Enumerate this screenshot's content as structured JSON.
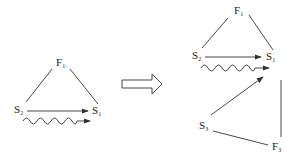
{
  "left_diagram": {
    "top_label": {
      "base": "F",
      "sub": "1"
    },
    "left_label": {
      "base": "S",
      "sub": "2"
    },
    "right_label": {
      "base": "S",
      "sub": "1"
    }
  },
  "right_diagram": {
    "top_label": {
      "base": "F",
      "sub": "1"
    },
    "left_label": {
      "base": "S",
      "sub": "2"
    },
    "right_label": {
      "base": "S",
      "sub": "1"
    },
    "bottom_left_label": {
      "base": "S",
      "sub": "3"
    },
    "bottom_right_label": {
      "base": "F",
      "sub": "3"
    }
  },
  "colors": {
    "stroke": "#333333",
    "text": "#222222"
  }
}
